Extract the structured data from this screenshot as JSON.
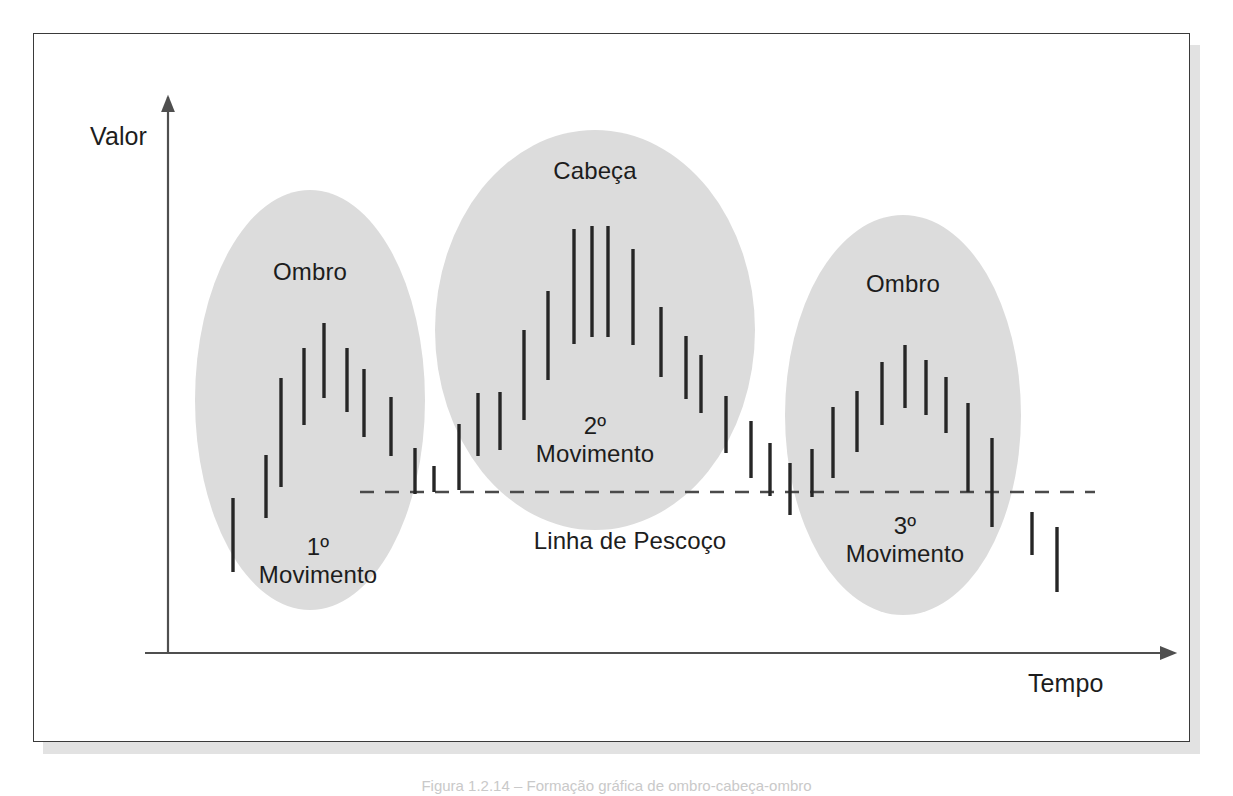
{
  "figure": {
    "domain_kind": "diagram",
    "caption": "Figura 1.2.14 – Formação gráfica de ombro-cabeça-ombro",
    "axes": {
      "y_label": "Valor",
      "x_label": "Tempo",
      "y_axis_x": 168,
      "x_axis_y": 653,
      "y_axis_top": 97,
      "x_axis_right": 1175
    },
    "neckline": {
      "label": "Linha de Pescoço",
      "y": 492,
      "x_start": 360,
      "x_end": 1095,
      "style": "dashed",
      "color": "#4a4a4a"
    },
    "zones": [
      {
        "id": "left-shoulder",
        "label": "Ombro",
        "cx": 310,
        "cy": 400,
        "rx": 115,
        "ry": 210,
        "label_y": 258
      },
      {
        "id": "head",
        "label": "Cabeça",
        "cx": 595,
        "cy": 330,
        "rx": 160,
        "ry": 200,
        "label_y": 168
      },
      {
        "id": "right-shoulder",
        "label": "Ombro",
        "cx": 903,
        "cy": 415,
        "rx": 118,
        "ry": 200,
        "label_y": 281
      }
    ],
    "movements": [
      {
        "id": "movement-1",
        "number": "1º",
        "word": "Movimento",
        "cx": 318,
        "top": 535
      },
      {
        "id": "movement-2",
        "number": "2º",
        "word": "Movimento",
        "cx": 595,
        "top": 414
      },
      {
        "id": "movement-3",
        "number": "3º",
        "word": "Movimento",
        "cx": 905,
        "top": 514
      }
    ],
    "colors": {
      "zone_fill": "#dcdcdc",
      "bar": "#262626",
      "axis": "#4f4f4f",
      "frame": "#3a3a3a",
      "shadow": "#e2e2e2",
      "text": "#1d1d1d",
      "page": "#ffffff"
    }
  },
  "chart_data": {
    "type": "bar",
    "title": "Ombro-Cabeça-Ombro",
    "xlabel": "Tempo",
    "ylabel": "Valor",
    "bars": [
      {
        "x": 233,
        "top": 498,
        "bottom": 572
      },
      {
        "x": 266,
        "top": 455,
        "bottom": 518
      },
      {
        "x": 281,
        "top": 378,
        "bottom": 487
      },
      {
        "x": 304,
        "top": 348,
        "bottom": 425
      },
      {
        "x": 324,
        "top": 323,
        "bottom": 398
      },
      {
        "x": 347,
        "top": 348,
        "bottom": 412
      },
      {
        "x": 364,
        "top": 369,
        "bottom": 437
      },
      {
        "x": 391,
        "top": 397,
        "bottom": 456
      },
      {
        "x": 415,
        "top": 448,
        "bottom": 494
      },
      {
        "x": 434,
        "top": 466,
        "bottom": 492
      },
      {
        "x": 459,
        "top": 424,
        "bottom": 490
      },
      {
        "x": 478,
        "top": 393,
        "bottom": 456
      },
      {
        "x": 500,
        "top": 392,
        "bottom": 450
      },
      {
        "x": 524,
        "top": 330,
        "bottom": 420
      },
      {
        "x": 548,
        "top": 291,
        "bottom": 380
      },
      {
        "x": 574,
        "top": 229,
        "bottom": 344
      },
      {
        "x": 592,
        "top": 226,
        "bottom": 337
      },
      {
        "x": 608,
        "top": 226,
        "bottom": 337
      },
      {
        "x": 633,
        "top": 249,
        "bottom": 345
      },
      {
        "x": 661,
        "top": 307,
        "bottom": 377
      },
      {
        "x": 686,
        "top": 336,
        "bottom": 399
      },
      {
        "x": 701,
        "top": 355,
        "bottom": 413
      },
      {
        "x": 726,
        "top": 396,
        "bottom": 453
      },
      {
        "x": 751,
        "top": 421,
        "bottom": 478
      },
      {
        "x": 770,
        "top": 443,
        "bottom": 496
      },
      {
        "x": 790,
        "top": 463,
        "bottom": 515
      },
      {
        "x": 812,
        "top": 449,
        "bottom": 497
      },
      {
        "x": 833,
        "top": 407,
        "bottom": 478
      },
      {
        "x": 857,
        "top": 391,
        "bottom": 452
      },
      {
        "x": 882,
        "top": 362,
        "bottom": 425
      },
      {
        "x": 905,
        "top": 345,
        "bottom": 408
      },
      {
        "x": 926,
        "top": 360,
        "bottom": 415
      },
      {
        "x": 946,
        "top": 377,
        "bottom": 433
      },
      {
        "x": 968,
        "top": 403,
        "bottom": 492
      },
      {
        "x": 992,
        "top": 438,
        "bottom": 527
      },
      {
        "x": 1032,
        "top": 512,
        "bottom": 555
      },
      {
        "x": 1057,
        "top": 527,
        "bottom": 592
      }
    ]
  }
}
